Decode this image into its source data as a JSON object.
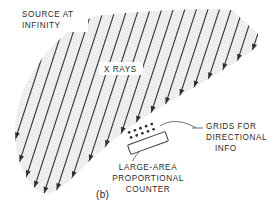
{
  "figure": {
    "caption": "(b)",
    "labels": {
      "source": [
        "SOURCE AT",
        "INFINITY"
      ],
      "rays": "X RAYS",
      "grids": [
        "GRIDS FOR",
        "DIRECTIONAL",
        "INFO"
      ],
      "counter": [
        "LARGE-AREA",
        "PROPORTIONAL",
        "COUNTER"
      ]
    },
    "colors": {
      "beam_fill": "#f0f0f0",
      "ray_stroke": "#3a3a3a",
      "text": "#2b2b2b",
      "leader": "#4a4a4a",
      "background": "#ffffff"
    }
  },
  "chart_data": {
    "type": "diagram",
    "title": "(b)",
    "beam": {
      "ray_count": 24,
      "ray_direction_degrees": 108,
      "note": "parallel arrows pointing down-right, arrowheads on the lower-right boundary"
    },
    "elements": [
      {
        "name": "source-at-infinity",
        "label": "SOURCE AT INFINITY",
        "x": 22,
        "y": 12
      },
      {
        "name": "x-rays",
        "label": "X RAYS",
        "x": 104,
        "y": 71
      },
      {
        "name": "grids-for-directional-info",
        "label": "GRIDS FOR DIRECTIONAL INFO",
        "x": 197,
        "y": 128
      },
      {
        "name": "large-area-proportional-counter",
        "label": "LARGE-AREA PROPORTIONAL COUNTER",
        "x": 148,
        "y": 166
      },
      {
        "name": "panel-caption",
        "label": "(b)",
        "x": 100,
        "y": 196
      }
    ],
    "detector": {
      "counter_rect": {
        "cx": 148,
        "cy": 143,
        "width": 40,
        "height": 10,
        "rotation_degrees": -20
      },
      "grid_rows": 2,
      "dots_per_row": 5
    }
  }
}
